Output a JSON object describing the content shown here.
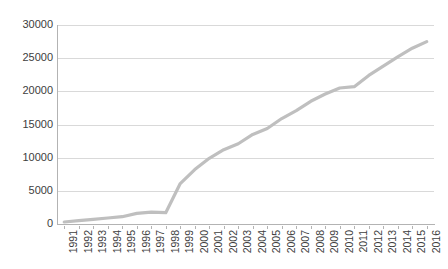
{
  "chart_data": {
    "type": "line",
    "title": "",
    "subtitle": "",
    "xlabel": "",
    "ylabel": "",
    "grid": true,
    "legend": false,
    "legend_position": "none",
    "line_color": "#bfbfbf",
    "gridline_color": "#d9d9d9",
    "axis_color": "#b3b3b3",
    "background_color": "#ffffff",
    "xlim": [
      1991,
      2016
    ],
    "ylim": [
      0,
      30000
    ],
    "y_tick_step": 5000,
    "y_ticks": [
      0,
      5000,
      10000,
      15000,
      20000,
      25000,
      30000
    ],
    "y_tick_labels": [
      "0",
      "5000",
      "10000",
      "15000",
      "20000",
      "25000",
      "30000"
    ],
    "categories": [
      "1991",
      "1992",
      "1993",
      "1994",
      "1995",
      "1996",
      "1997",
      "1998",
      "1999",
      "2000",
      "2001",
      "2002",
      "2003",
      "2004",
      "2005",
      "2006",
      "2007",
      "2008",
      "2009",
      "2010",
      "2011",
      "2012",
      "2013",
      "2014",
      "2015",
      "2016"
    ],
    "x": [
      1991,
      1992,
      1993,
      1994,
      1995,
      1996,
      1997,
      1998,
      1999,
      2000,
      2001,
      2002,
      2003,
      2004,
      2005,
      2006,
      2007,
      2008,
      2009,
      2010,
      2011,
      2012,
      2013,
      2014,
      2015,
      2016
    ],
    "values": [
      300,
      500,
      700,
      900,
      1100,
      1600,
      1800,
      1700,
      6100,
      8200,
      9900,
      11200,
      12100,
      13500,
      14400,
      15900,
      17100,
      18500,
      19600,
      20500,
      20700,
      22400,
      23800,
      25200,
      26500,
      27500
    ],
    "series": [
      {
        "name": "Series 1",
        "values": [
          300,
          500,
          700,
          900,
          1100,
          1600,
          1800,
          1700,
          6100,
          8200,
          9900,
          11200,
          12100,
          13500,
          14400,
          15900,
          17100,
          18500,
          19600,
          20500,
          20700,
          22400,
          23800,
          25200,
          26500,
          27500
        ]
      }
    ]
  }
}
